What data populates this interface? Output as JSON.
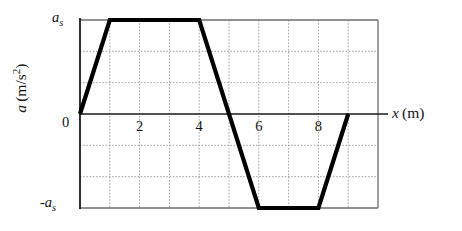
{
  "chart_data": {
    "type": "line",
    "title": "",
    "xlabel": "x (m)",
    "ylabel": "a (m/s²)",
    "xlim": [
      0,
      10
    ],
    "ylim": [
      -1,
      1
    ],
    "grid": true,
    "legend": "none",
    "x_ticks": [
      {
        "value": 2,
        "label": "2"
      },
      {
        "value": 4,
        "label": "4"
      },
      {
        "value": 6,
        "label": "6"
      },
      {
        "value": 8,
        "label": "8"
      }
    ],
    "y_ticks": [
      {
        "value": 1,
        "label": "a_s"
      },
      {
        "value": 0,
        "label": "0"
      },
      {
        "value": -1,
        "label": "-a_s"
      }
    ],
    "x_gridlines": [
      1,
      2,
      3,
      4,
      5,
      6,
      7,
      8,
      9
    ],
    "y_gridlines": [
      0.6667,
      0.3333,
      -0.3333,
      -0.6667
    ],
    "series": [
      {
        "name": "acceleration",
        "color": "#000000",
        "x": [
          0,
          1,
          4,
          6,
          8,
          9
        ],
        "y": [
          0,
          1,
          1,
          -1,
          -1,
          0
        ]
      }
    ]
  },
  "labels": {
    "y_axis": "a (m/s²)",
    "y_axis_symbol": "a",
    "y_axis_units": "(m/s",
    "y_axis_exponent": "2",
    "y_axis_units_close": ")",
    "x_axis_symbol": "x",
    "x_axis_units": "(m)",
    "top_value": "a",
    "top_value_sub": "s",
    "bottom_value_sign": "-",
    "bottom_value": "a",
    "bottom_value_sub": "s",
    "zero": "0",
    "tick_2": "2",
    "tick_4": "4",
    "tick_6": "6",
    "tick_8": "8"
  },
  "colors": {
    "curve": "#000000",
    "frame": "#6e6e6e",
    "grid": "#9a9a9a",
    "zero_line": "#1a1a1a",
    "background": "#ffffff",
    "text": "#141414"
  }
}
